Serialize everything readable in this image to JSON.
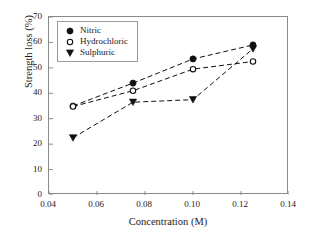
{
  "chart_data": {
    "type": "scatter",
    "title": "",
    "xlabel": "Concentration (M)",
    "ylabel": "Strength loss (%)",
    "xlim": [
      0.04,
      0.14
    ],
    "ylim": [
      0,
      70
    ],
    "xticks": [
      "0.04",
      "0.06",
      "0.08",
      "0.10",
      "0.12",
      "0.14"
    ],
    "xtick_values": [
      0.04,
      0.06,
      0.08,
      0.1,
      0.12,
      0.14
    ],
    "yticks": [
      "0",
      "10",
      "20",
      "30",
      "40",
      "50",
      "60",
      "70"
    ],
    "ytick_values": [
      0,
      10,
      20,
      30,
      40,
      50,
      60,
      70
    ],
    "grid": false,
    "legend_position": "upper-left",
    "x": [
      0.05,
      0.075,
      0.1,
      0.125
    ],
    "series": [
      {
        "name": "Nitric",
        "marker": "filled-circle",
        "linestyle": "dashed",
        "color": "#111111",
        "values": [
          35.0,
          44.0,
          53.5,
          59.0
        ]
      },
      {
        "name": "Hydrochloric",
        "marker": "open-circle",
        "linestyle": "dashed",
        "color": "#111111",
        "values": [
          34.8,
          41.0,
          49.5,
          52.5
        ]
      },
      {
        "name": "Sulphuric",
        "marker": "filled-triangle-down",
        "linestyle": "dashed",
        "color": "#111111",
        "values": [
          22.5,
          36.5,
          37.5,
          57.5
        ]
      }
    ]
  },
  "legend": {
    "entries": [
      {
        "label": "Nitric"
      },
      {
        "label": "Hydrochloric"
      },
      {
        "label": "Sulphuric"
      }
    ]
  }
}
